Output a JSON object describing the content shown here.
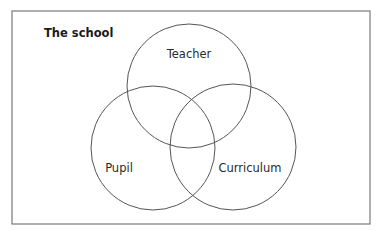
{
  "diagram": {
    "type": "venn",
    "title": "The school",
    "sets": [
      {
        "id": "teacher",
        "label": "Teacher",
        "cx": 189,
        "cy": 86,
        "r": 62,
        "label_x": 189,
        "label_y": 58
      },
      {
        "id": "pupil",
        "label": "Pupil",
        "cx": 153,
        "cy": 148,
        "r": 62,
        "label_x": 119,
        "label_y": 172
      },
      {
        "id": "curriculum",
        "label": "Curriculum",
        "cx": 233,
        "cy": 147,
        "r": 63,
        "label_x": 250,
        "label_y": 172
      }
    ],
    "frame_color": "#7a7a7a",
    "circle_color": "#555555"
  }
}
